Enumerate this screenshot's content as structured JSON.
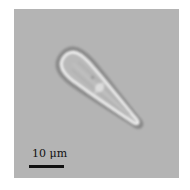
{
  "image": {
    "description": "Brightfield micrograph of an elongated teardrop-shaped cell",
    "background_color": "#b4b4b4"
  },
  "scale_bar": {
    "label": "10 μm",
    "color": "#111111"
  }
}
